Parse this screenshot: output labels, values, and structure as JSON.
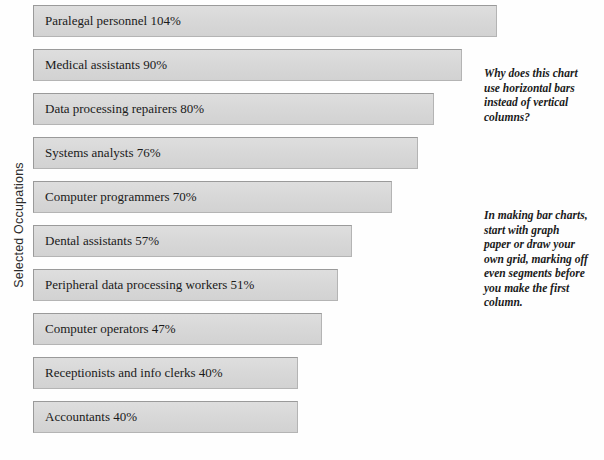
{
  "axis": {
    "y_label": "Selected Occupations"
  },
  "chart_data": {
    "type": "bar",
    "orientation": "horizontal",
    "title": "",
    "xlabel": "",
    "ylabel": "Selected Occupations",
    "grid": false,
    "legend": false,
    "xlim": [
      0,
      104
    ],
    "categories": [
      "Paralegal personnel",
      "Medical assistants",
      "Data processing repairers",
      "Systems analysts",
      "Computer programmers",
      "Dental assistants",
      "Peripheral data processing workers",
      "Computer operators",
      "Receptionists and info clerks",
      "Accountants"
    ],
    "values": [
      104,
      90,
      80,
      76,
      70,
      57,
      51,
      47,
      40,
      40
    ],
    "unit": "%",
    "bars": [
      {
        "label": "Paralegal personnel 104%",
        "category": "Paralegal personnel",
        "value": 104,
        "bar_px": 464
      },
      {
        "label": "Medical assistants 90%",
        "category": "Medical assistants",
        "value": 90,
        "bar_px": 429
      },
      {
        "label": "Data processing repairers 80%",
        "category": "Data processing repairers",
        "value": 80,
        "bar_px": 401
      },
      {
        "label": "Systems analysts 76%",
        "category": "Systems analysts",
        "value": 76,
        "bar_px": 385
      },
      {
        "label": "Computer programmers 70%",
        "category": "Computer programmers",
        "value": 70,
        "bar_px": 359
      },
      {
        "label": "Dental assistants 57%",
        "category": "Dental assistants",
        "value": 57,
        "bar_px": 319
      },
      {
        "label": "Peripheral data processing workers 51%",
        "category": "Peripheral data processing workers",
        "value": 51,
        "bar_px": 305
      },
      {
        "label": "Computer operators 47%",
        "category": "Computer operators",
        "value": 47,
        "bar_px": 289
      },
      {
        "label": "Receptionists and info clerks 40%",
        "category": "Receptionists and info clerks",
        "value": 40,
        "bar_px": 265
      },
      {
        "label": "Accountants 40%",
        "category": "Accountants",
        "value": 40,
        "bar_px": 265
      }
    ]
  },
  "annotations": [
    {
      "id": "annotation-1",
      "text": "Why does this chart use horizontal bars instead of vertical columns?"
    },
    {
      "id": "annotation-2",
      "text": "In making bar charts, start with graph paper or draw your own grid, marking off even segments before you make the first column."
    }
  ],
  "colors": {
    "bar_fill": "#d9d9d9",
    "bar_shadow": "#2a2a2a",
    "bar_border": "#9a9a9a",
    "text": "#1a1a1a",
    "background": "#fefefe"
  }
}
